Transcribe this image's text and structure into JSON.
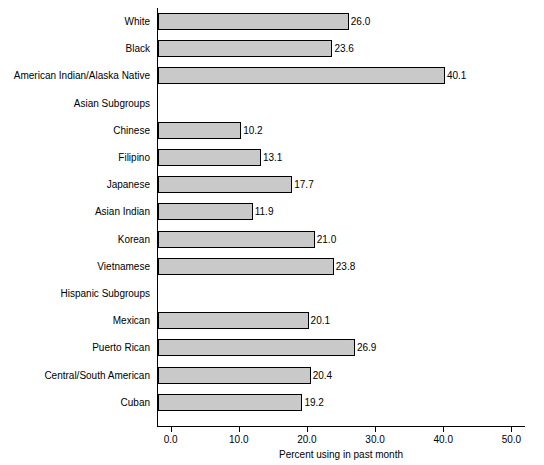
{
  "chart_data": {
    "type": "bar",
    "orientation": "horizontal",
    "title": "",
    "xlabel": "Percent using in past month",
    "ylabel": "",
    "xlim": [
      -2.0,
      52.0
    ],
    "xticks": [
      0.0,
      10.0,
      20.0,
      30.0,
      40.0,
      50.0
    ],
    "xticklabels": [
      "0.0",
      "10.0",
      "20.0",
      "30.0",
      "40.0",
      "50.0"
    ],
    "grid": false,
    "legend": null,
    "bar_color": "#c9c9c9",
    "bar_edge_color": "#000000",
    "categories": [
      "White",
      "Black",
      "American Indian/Alaska Native",
      "Asian Subgroups",
      "Chinese",
      "Filipino",
      "Japanese",
      "Asian Indian",
      "Korean",
      "Vietnamese",
      "Hispanic Subgroups",
      "Mexican",
      "Puerto Rican",
      "Central/South American",
      "Cuban"
    ],
    "values": [
      26.0,
      23.6,
      40.1,
      null,
      10.2,
      13.1,
      17.7,
      11.9,
      21.0,
      23.8,
      null,
      20.1,
      26.9,
      20.4,
      19.2
    ],
    "data_labels": [
      "26.0",
      "23.6",
      "40.1",
      "",
      "10.2",
      "13.1",
      "17.7",
      "11.9",
      "21.0",
      "23.8",
      "",
      "20.1",
      "26.9",
      "20.4",
      "19.2"
    ]
  }
}
